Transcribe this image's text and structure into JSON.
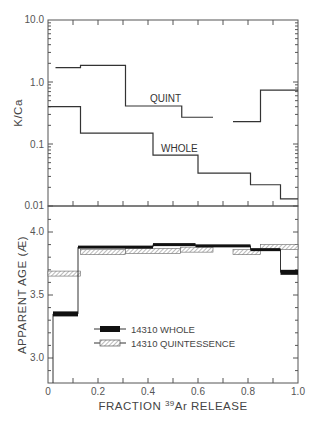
{
  "chart_data": [
    {
      "type": "line",
      "step": true,
      "title": "",
      "xlabel": "",
      "ylabel": "K/Ca",
      "yscale": "log",
      "ylim": [
        0.01,
        10.0
      ],
      "xlim": [
        0,
        1.0
      ],
      "yticks": [
        "10.0",
        "1.0",
        "0.1",
        "0.01"
      ],
      "grid": false,
      "series": [
        {
          "name": "QUINT",
          "segments": [
            {
              "x0": 0.03,
              "x1": 0.13,
              "y": 1.7
            },
            {
              "x0": 0.13,
              "x1": 0.31,
              "y": 1.85
            },
            {
              "x0": 0.31,
              "x1": 0.535,
              "y": 0.41
            },
            {
              "x0": 0.535,
              "x1": 0.66,
              "y": 0.27
            },
            {
              "x0": 0.74,
              "x1": 0.85,
              "y": 0.23
            },
            {
              "x0": 0.85,
              "x1": 1.0,
              "y": 0.74
            }
          ]
        },
        {
          "name": "WHOLE",
          "segments": [
            {
              "x0": 0.0,
              "x1": 0.13,
              "y": 0.4
            },
            {
              "x0": 0.13,
              "x1": 0.42,
              "y": 0.15
            },
            {
              "x0": 0.42,
              "x1": 0.6,
              "y": 0.066
            },
            {
              "x0": 0.6,
              "x1": 0.81,
              "y": 0.034
            },
            {
              "x0": 0.81,
              "x1": 0.93,
              "y": 0.022
            },
            {
              "x0": 0.93,
              "x1": 1.0,
              "y": 0.013
            }
          ]
        }
      ]
    },
    {
      "type": "bar",
      "step": true,
      "title": "",
      "xlabel": "FRACTION 39Ar RELEASE",
      "ylabel": "APPARENT AGE (Æ)",
      "ylim": [
        2.8,
        4.2
      ],
      "xlim": [
        0,
        1.0
      ],
      "xticks": [
        "0",
        "0.2",
        "0.4",
        "0.6",
        "0.8",
        "1.0"
      ],
      "yticks": [
        "4.0",
        "3.5",
        "3.0"
      ],
      "grid": false,
      "legend_position": "lower-center",
      "series": [
        {
          "name": "14310 WHOLE",
          "style": "solid-black",
          "segments": [
            {
              "x0": 0.02,
              "x1": 0.12,
              "y": 3.35
            },
            {
              "x0": 0.12,
              "x1": 0.42,
              "y": 3.88
            },
            {
              "x0": 0.42,
              "x1": 0.59,
              "y": 3.9
            },
            {
              "x0": 0.59,
              "x1": 0.81,
              "y": 3.89
            },
            {
              "x0": 0.81,
              "x1": 0.93,
              "y": 3.86
            },
            {
              "x0": 0.93,
              "x1": 1.0,
              "y": 3.68
            }
          ]
        },
        {
          "name": "14310 QUINTESSENCE",
          "style": "hatched",
          "segments": [
            {
              "x0": 0.0,
              "x1": 0.13,
              "y": 3.67
            },
            {
              "x0": 0.13,
              "x1": 0.31,
              "y": 3.84
            },
            {
              "x0": 0.31,
              "x1": 0.53,
              "y": 3.85
            },
            {
              "x0": 0.53,
              "x1": 0.66,
              "y": 3.86
            },
            {
              "x0": 0.74,
              "x1": 0.85,
              "y": 3.84
            },
            {
              "x0": 0.85,
              "x1": 1.0,
              "y": 3.88
            }
          ]
        }
      ]
    }
  ],
  "top": {
    "ylabel": "K/Ca",
    "yticks": [
      "10.0",
      "1.0",
      "0.1",
      "0.01"
    ],
    "labels": {
      "quint": "QUINT",
      "whole": "WHOLE"
    }
  },
  "bottom": {
    "ylabel": "APPARENT AGE (Æ)",
    "yticks": [
      "4.0",
      "3.5",
      "3.0"
    ],
    "xticks": [
      "0",
      "0.2",
      "0.4",
      "0.6",
      "0.8",
      "1.0"
    ],
    "xlabel_prefix": "FRACTION ",
    "xlabel_sup": "39",
    "xlabel_suffix": "Ar RELEASE",
    "legend": [
      "14310 WHOLE",
      "14310 QUINTESSENCE"
    ]
  },
  "colors": {
    "ink": "#333333",
    "axis": "#555555",
    "fill": "#111111",
    "hatch": "#777777"
  }
}
